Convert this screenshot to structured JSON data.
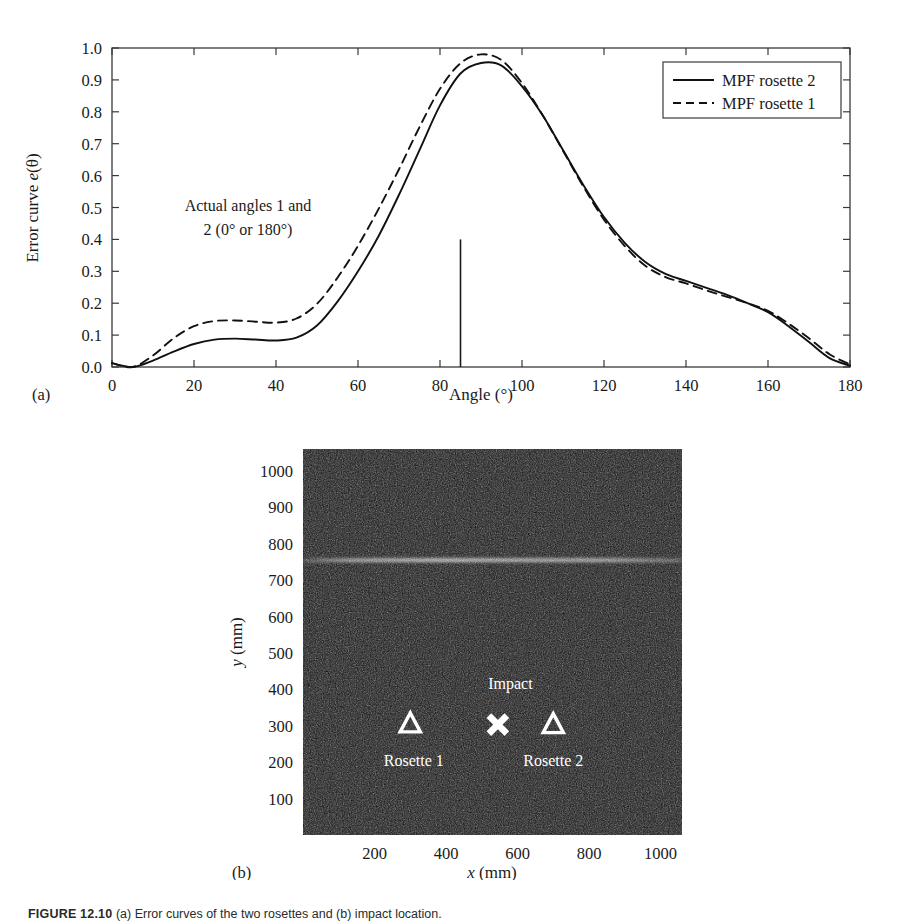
{
  "figure": {
    "caption_label": "FIGURE 12.10",
    "caption_text": "(a) Error curves of the two rosettes and (b) impact location."
  },
  "panel_a": {
    "letter": "(a)",
    "xlabel": "Angle (°)",
    "ylabel_prefix": "Error curve ",
    "ylabel_italic": "e",
    "ylabel_suffix": "(θ)",
    "annotation_line1": "Actual angles 1 and",
    "annotation_line2": "2 (0° or 180°)",
    "legend": [
      {
        "label": "MPF rosette 2",
        "style": "solid"
      },
      {
        "label": "MPF rosette 1",
        "style": "dashed"
      }
    ],
    "xticks": [
      0,
      20,
      40,
      60,
      80,
      100,
      120,
      140,
      160,
      180
    ],
    "yticks": [
      "0.0",
      "0.1",
      "0.2",
      "0.3",
      "0.4",
      "0.5",
      "0.6",
      "0.7",
      "0.8",
      "0.9",
      "1.0"
    ],
    "marker_line": {
      "angle": 85,
      "height": 0.4
    }
  },
  "panel_b": {
    "letter": "(b)",
    "xlabel_italic": "x",
    "xlabel_rest": " (mm)",
    "ylabel_italic": "y",
    "ylabel_rest": " (mm)",
    "xticks": [
      200,
      400,
      600,
      800,
      1000
    ],
    "yticks": [
      100,
      200,
      300,
      400,
      500,
      600,
      700,
      800,
      900,
      1000
    ],
    "markers": [
      {
        "name": "Rosette 1",
        "glyph": "triangle",
        "x": 300,
        "y": 305,
        "label": "Rosette 1",
        "label_x": 310,
        "label_y": 190
      },
      {
        "name": "Impact",
        "glyph": "cross",
        "x": 545,
        "y": 303,
        "label": "Impact",
        "label_x": 580,
        "label_y": 400
      },
      {
        "name": "Rosette 2",
        "glyph": "triangle",
        "x": 700,
        "y": 303,
        "label": "Rosette 2",
        "label_x": 700,
        "label_y": 190
      }
    ]
  },
  "chart_data": [
    {
      "type": "line",
      "panel": "a",
      "title": "",
      "xlabel": "Angle (°)",
      "ylabel": "Error curve e(θ)",
      "xlim": [
        0,
        180
      ],
      "ylim": [
        0.0,
        1.0
      ],
      "grid": false,
      "legend_position": "top-right",
      "annotations": [
        {
          "text": "Actual angles 1 and 2 (0° or 180°)",
          "x": 30,
          "y": 0.44
        },
        {
          "text": "vertical marker",
          "x": 85,
          "y": 0.4
        }
      ],
      "x": [
        0,
        5,
        10,
        15,
        20,
        25,
        30,
        35,
        40,
        45,
        50,
        55,
        60,
        65,
        70,
        75,
        80,
        85,
        90,
        95,
        100,
        105,
        110,
        115,
        120,
        125,
        130,
        135,
        140,
        145,
        150,
        155,
        160,
        165,
        170,
        175,
        180
      ],
      "series": [
        {
          "name": "MPF rosette 2",
          "style": "solid",
          "values": [
            0.012,
            0.0,
            0.02,
            0.048,
            0.072,
            0.086,
            0.089,
            0.086,
            0.083,
            0.092,
            0.13,
            0.205,
            0.3,
            0.41,
            0.54,
            0.68,
            0.82,
            0.92,
            0.953,
            0.945,
            0.88,
            0.79,
            0.68,
            0.57,
            0.47,
            0.39,
            0.33,
            0.292,
            0.27,
            0.248,
            0.226,
            0.2,
            0.172,
            0.128,
            0.078,
            0.028,
            0.004
          ]
        },
        {
          "name": "MPF rosette 1",
          "style": "dashed",
          "values": [
            0.012,
            0.0,
            0.036,
            0.09,
            0.128,
            0.144,
            0.146,
            0.142,
            0.139,
            0.152,
            0.198,
            0.28,
            0.38,
            0.495,
            0.62,
            0.752,
            0.872,
            0.952,
            0.98,
            0.962,
            0.89,
            0.79,
            0.678,
            0.565,
            0.462,
            0.38,
            0.318,
            0.282,
            0.262,
            0.24,
            0.22,
            0.2,
            0.176,
            0.136,
            0.09,
            0.04,
            0.008
          ]
        }
      ]
    },
    {
      "type": "scatter",
      "panel": "b",
      "title": "",
      "xlabel": "x (mm)",
      "ylabel": "y (mm)",
      "xlim": [
        0,
        1060
      ],
      "ylim": [
        0,
        1060
      ],
      "grid": false,
      "background": "speckle-noise-image",
      "points": [
        {
          "label": "Rosette 1",
          "marker": "triangle",
          "x": 300,
          "y": 305
        },
        {
          "label": "Impact",
          "marker": "cross",
          "x": 545,
          "y": 303
        },
        {
          "label": "Rosette 2",
          "marker": "triangle",
          "x": 700,
          "y": 303
        }
      ]
    }
  ]
}
